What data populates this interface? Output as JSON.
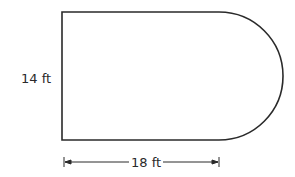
{
  "diagram": {
    "type": "composite-shape",
    "labels": {
      "height": "14 ft",
      "width": "18 ft"
    },
    "dimensions": {
      "rectangle_height_ft": 14,
      "rectangle_width_ft": 18,
      "semicircle_diameter_ft": 14
    },
    "colors": {
      "stroke": "#2a2a2a",
      "background": "#ffffff"
    }
  }
}
